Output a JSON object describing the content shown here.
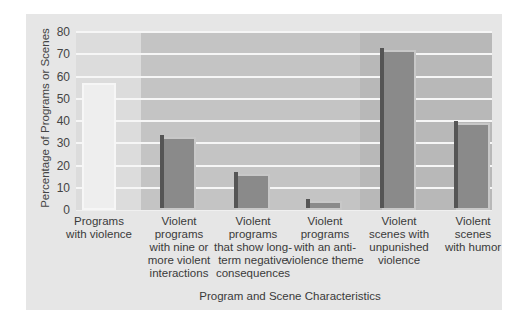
{
  "chart_data": {
    "type": "bar",
    "title": "",
    "xlabel": "Program and Scene Characteristics",
    "ylabel": "Percentage of Programs or Scenes",
    "ylim": [
      0,
      80
    ],
    "yticks": [
      0,
      10,
      20,
      30,
      40,
      50,
      60,
      70,
      80
    ],
    "grid": true,
    "legend": null,
    "categories": [
      "Programs with violence",
      "Violent programs with nine or more violent interactions",
      "Violent programs that show long-term negative consequences",
      "Violent programs with an anti-violence theme",
      "Violent scenes with unpunished violence",
      "Violent scenes with humor"
    ],
    "values": [
      57,
      33,
      16,
      4,
      72,
      39
    ]
  },
  "axis": {
    "ylabel": "Percentage of Programs or Scenes",
    "xlabel": "Program and Scene Characteristics",
    "yticks": [
      "0",
      "10",
      "20",
      "30",
      "40",
      "50",
      "60",
      "70",
      "80"
    ]
  },
  "labels": [
    [
      "Programs",
      "with violence"
    ],
    [
      "Violent",
      "programs",
      "with nine or",
      "more violent",
      "interactions"
    ],
    [
      "Violent",
      "programs",
      "that show long-",
      "term negative",
      "consequences"
    ],
    [
      "Violent",
      "programs",
      "with an anti-",
      "violence theme"
    ],
    [
      "Violent",
      "scenes with",
      "unpunished",
      "violence"
    ],
    [
      "Violent",
      "scenes",
      "with humor"
    ]
  ],
  "colors": {
    "panel": "#e6e6e6",
    "section_light": "#dcdcdc",
    "section_mid": "#c4c4c4",
    "section_dark": "#b8b8b8",
    "bar_light": "#eeeeee",
    "bar_dark": "#8a8a8a"
  }
}
